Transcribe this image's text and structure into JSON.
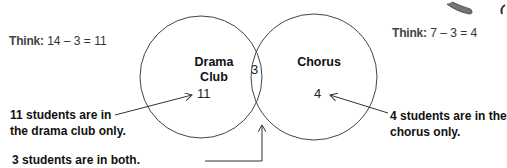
{
  "think_left": {
    "prefix": "Think:",
    "expr": "14 – 3 = 11"
  },
  "think_right": {
    "prefix": "Think:",
    "expr": "7 – 3 = 4"
  },
  "circles": {
    "left": {
      "label_line1": "Drama",
      "label_line2": "Club",
      "only_count": "11"
    },
    "right": {
      "label": "Chorus",
      "only_count": "4"
    },
    "overlap_count": "3"
  },
  "notes": {
    "drama_only_line1": "11 students are in",
    "drama_only_line2": "the drama club only.",
    "chorus_only_line1": "4 students are in the",
    "chorus_only_line2": "chorus only.",
    "both": "3 students are in both."
  },
  "colors": {
    "stroke": "#444444",
    "text": "#111111"
  }
}
